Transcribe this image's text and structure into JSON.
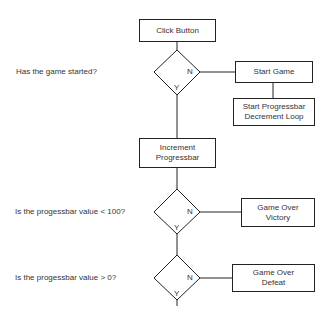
{
  "flowchart": {
    "nodes": {
      "click_button": "Click Button",
      "start_game": "Start Game",
      "start_loop": "Start Progressbar\nDecrement Loop",
      "increment": "Increment\nProgressbar",
      "victory": "Game Over\nVictory",
      "defeat": "Game Over\nDefeat"
    },
    "questions": {
      "q1": "Has the game started?",
      "q2": "Is the progessbar value < 100?",
      "q3": "Is the progessbar value > 0?"
    },
    "decision_labels": {
      "yes": "Y",
      "no": "N"
    },
    "colors": {
      "stroke": "#222222",
      "text": "#333333",
      "background": "#ffffff"
    }
  }
}
